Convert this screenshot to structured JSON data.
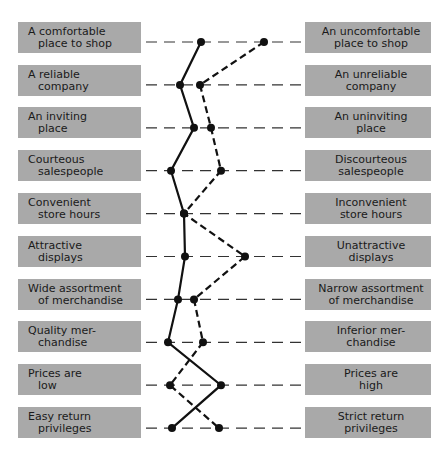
{
  "diagram": {
    "type": "semantic-differential profile",
    "rows": [
      {
        "left": [
          "A comfortable",
          "place to shop"
        ],
        "right": [
          "An uncomfortable",
          "place to shop"
        ]
      },
      {
        "left": [
          "A reliable",
          "company"
        ],
        "right": [
          "An unreliable",
          "company"
        ]
      },
      {
        "left": [
          "An inviting",
          "place"
        ],
        "right": [
          "An uninviting",
          "place"
        ]
      },
      {
        "left": [
          "Courteous",
          "salespeople"
        ],
        "right": [
          "Discourteous",
          "salespeople"
        ]
      },
      {
        "left": [
          "Convenient",
          "store hours"
        ],
        "right": [
          "Inconvenient",
          "store hours"
        ]
      },
      {
        "left": [
          "Attractive",
          "displays"
        ],
        "right": [
          "Unattractive",
          "displays"
        ]
      },
      {
        "left": [
          "Wide assortment",
          "of merchandise"
        ],
        "right": [
          "Narrow assortment",
          "of merchandise"
        ]
      },
      {
        "left": [
          "Quality mer-",
          "chandise"
        ],
        "right": [
          "Inferior mer-",
          "chandise"
        ]
      },
      {
        "left": [
          "Prices are",
          "low"
        ],
        "right": [
          "Prices are",
          "high"
        ]
      },
      {
        "left": [
          "Easy return",
          "privileges"
        ],
        "right": [
          "Strict return",
          "privileges"
        ]
      }
    ],
    "series": [
      {
        "name": "solid-profile",
        "style": "solid",
        "x": [
          201,
          180,
          194,
          171,
          184,
          185,
          178,
          168,
          221,
          172
        ]
      },
      {
        "name": "dashed-profile",
        "style": "dashed",
        "x": [
          264,
          200,
          211,
          221,
          184,
          245,
          194,
          203,
          170,
          219
        ]
      }
    ],
    "colors": {
      "box": "#a9a9a9",
      "text": "#1a1a1a",
      "line": "#111111"
    }
  }
}
